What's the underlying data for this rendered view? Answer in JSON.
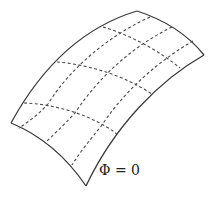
{
  "figure": {
    "label": "Φ = 0",
    "colors": {
      "edge": "#3a3a3a",
      "grid": "#4a4a4a",
      "background": "#ffffff"
    },
    "corners": {
      "top": [
        137,
        11
      ],
      "right": [
        204,
        55
      ],
      "bottom": [
        86,
        186
      ],
      "left": [
        11,
        123
      ]
    },
    "grid_lines": {
      "direction_a_count": 3,
      "direction_b_count": 3
    }
  }
}
